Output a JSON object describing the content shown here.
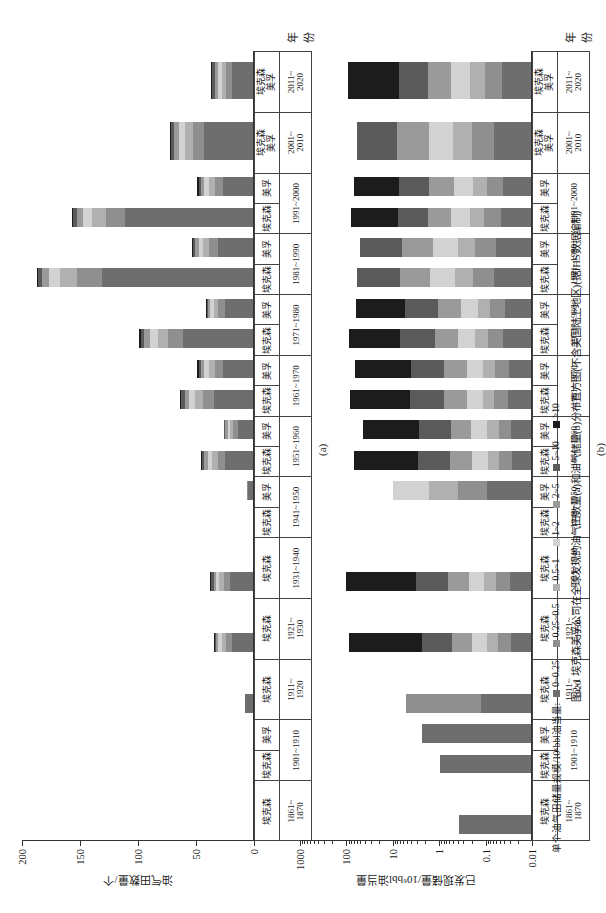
{
  "caption": "图2-1  埃克森美孚公司在全球发现的油气田数量(a)和油气储量(b)分布直方图(不含美国陆上地区)(据IHS数据编制)",
  "legend": {
    "title": "单个油气田储量规模/10⁶bbl油当量:",
    "items": [
      {
        "label": "0~0.25",
        "color": "#6e6e6e"
      },
      {
        "label": "0.25~0.5",
        "color": "#8f8f8f"
      },
      {
        "label": "0.5~1",
        "color": "#b0b0b0"
      },
      {
        "label": "1~2",
        "color": "#d2d2d2"
      },
      {
        "label": "2~5",
        "color": "#9a9a9a"
      },
      {
        "label": "5~10",
        "color": "#5a5a5a"
      },
      {
        "label": ">10",
        "color": "#1c1c1c"
      }
    ]
  },
  "panel_a": {
    "letter": "(a)",
    "ylabel": "油气田数量/个",
    "xlabel": "年份"
  },
  "panel_b": {
    "letter": "(b)",
    "ylabel": "已发现储量/10⁶bbl油当量",
    "xlabel": "年份"
  },
  "companies": {
    "exxon": "埃克森",
    "mobil": "美孚"
  },
  "decades": [
    "1861~1870",
    "1901~1910",
    "1911~1920",
    "1921~1930",
    "1931~1940",
    "1941~1950",
    "1951~1960",
    "1961~1970",
    "1971~1980",
    "1981~1990",
    "1991~2000",
    "2001~2010",
    "2011~2020"
  ],
  "chart_data": [
    {
      "type": "bar",
      "id": "a",
      "title": "油气田数量(a)",
      "xlabel": "年份",
      "ylabel": "油气田数量/个",
      "ylim": [
        0,
        200
      ],
      "yticks": [
        0,
        50,
        100,
        150,
        200
      ],
      "scale": "linear",
      "grid": false,
      "legend_position": "bottom",
      "stack_order": [
        "0~0.25",
        "0.25~0.5",
        "0.5~1",
        "1~2",
        "2~5",
        "5~10",
        ">10"
      ],
      "categories": [
        "1861~1870 埃克森",
        "1901~1910 埃克森",
        "1901~1910 美孚",
        "1911~1920 埃克森",
        "1921~1930 埃克森",
        "1931~1940 埃克森",
        "1941~1950 埃克森",
        "1941~1950 美孚",
        "1951~1960 埃克森",
        "1951~1960 美孚",
        "1961~1970 埃克森",
        "1961~1970 美孚",
        "1971~1980 埃克森",
        "1971~1980 美孚",
        "1981~1990 埃克森",
        "1981~1990 美孚",
        "1991~2000 埃克森",
        "1991~2000 美孚",
        "2001~2010 埃克森美孚",
        "2011~2020 埃克森美孚"
      ],
      "bars": [
        {
          "decade": "1861~1870",
          "company": "埃克森",
          "segments": [
            0,
            0,
            0,
            0,
            0,
            0,
            0
          ]
        },
        {
          "decade": "1901~1910",
          "company": "埃克森",
          "segments": [
            0,
            0,
            0,
            0,
            0,
            0,
            0
          ]
        },
        {
          "decade": "1901~1910",
          "company": "美孚",
          "segments": [
            0,
            0,
            0,
            0,
            0,
            0,
            0
          ]
        },
        {
          "decade": "1911~1920",
          "company": "埃克森",
          "segments": [
            7,
            0,
            0,
            0,
            0,
            0,
            0
          ]
        },
        {
          "decade": "1921~1930",
          "company": "埃克森",
          "segments": [
            18,
            5,
            4,
            3,
            2,
            1,
            1
          ]
        },
        {
          "decade": "1931~1940",
          "company": "埃克森",
          "segments": [
            20,
            5,
            4,
            3,
            2,
            2,
            1
          ]
        },
        {
          "decade": "1941~1950",
          "company": "埃克森",
          "segments": [
            0,
            0,
            0,
            0,
            0,
            0,
            0
          ]
        },
        {
          "decade": "1941~1950",
          "company": "美孚",
          "segments": [
            4,
            1,
            0,
            0,
            0,
            0,
            0
          ]
        },
        {
          "decade": "1951~1960",
          "company": "埃克森",
          "segments": [
            24,
            6,
            5,
            4,
            3,
            2,
            1
          ]
        },
        {
          "decade": "1951~1960",
          "company": "美孚",
          "segments": [
            13,
            4,
            3,
            2,
            2,
            1,
            0
          ]
        },
        {
          "decade": "1961~1970",
          "company": "埃克森",
          "segments": [
            34,
            9,
            7,
            5,
            4,
            3,
            1
          ]
        },
        {
          "decade": "1961~1970",
          "company": "美孚",
          "segments": [
            26,
            7,
            5,
            4,
            3,
            2,
            1
          ]
        },
        {
          "decade": "1971~1980",
          "company": "埃克森",
          "segments": [
            60,
            13,
            9,
            7,
            5,
            3,
            1
          ]
        },
        {
          "decade": "1971~1980",
          "company": "美孚",
          "segments": [
            24,
            6,
            4,
            3,
            2,
            1,
            1
          ]
        },
        {
          "decade": "1981~1990",
          "company": "埃克森",
          "segments": [
            130,
            22,
            14,
            10,
            6,
            3,
            1
          ]
        },
        {
          "decade": "1981~1990",
          "company": "美孚",
          "segments": [
            30,
            8,
            5,
            4,
            3,
            2,
            1
          ]
        },
        {
          "decade": "1991~2000",
          "company": "埃克森",
          "segments": [
            110,
            17,
            12,
            8,
            5,
            3,
            1
          ]
        },
        {
          "decade": "1991~2000",
          "company": "美孚",
          "segments": [
            26,
            7,
            5,
            4,
            3,
            2,
            1
          ]
        },
        {
          "decade": "2001~2010",
          "company": "埃克森美孚",
          "segments": [
            42,
            10,
            7,
            5,
            4,
            3,
            1
          ]
        },
        {
          "decade": "2011~2020",
          "company": "埃克森美孚",
          "segments": [
            18,
            5,
            4,
            3,
            3,
            2,
            1
          ]
        }
      ]
    },
    {
      "type": "bar",
      "id": "b",
      "title": "油气储量(b)",
      "xlabel": "年份",
      "ylabel": "已发现储量/10⁶bbl油当量",
      "ylim": [
        0.01,
        1000
      ],
      "yticks": [
        0.01,
        0.1,
        1,
        10,
        100,
        1000
      ],
      "scale": "log",
      "grid": false,
      "legend_position": "bottom",
      "stack_order": [
        "0~0.25",
        "0.25~0.5",
        "0.5~1",
        "1~2",
        "2~5",
        "5~10",
        ">10"
      ],
      "bars": [
        {
          "decade": "1861~1870",
          "company": "埃克森",
          "segments": [
            0.35,
            0,
            0,
            0,
            0,
            0,
            0
          ]
        },
        {
          "decade": "1901~1910",
          "company": "埃克森",
          "segments": [
            0.9,
            0,
            0,
            0,
            0,
            0,
            0
          ]
        },
        {
          "decade": "1901~1910",
          "company": "美孚",
          "segments": [
            2.2,
            0,
            0,
            0,
            0,
            0,
            0
          ]
        },
        {
          "decade": "1911~1920",
          "company": "埃克森",
          "segments": [
            2.0,
            3.0,
            0,
            0,
            0,
            0,
            0
          ]
        },
        {
          "decade": "1921~1930",
          "company": "埃克森",
          "segments": [
            9,
            6,
            5,
            7,
            9,
            14,
            33
          ]
        },
        {
          "decade": "1931~1940",
          "company": "埃克森",
          "segments": [
            11,
            7,
            6,
            8,
            11,
            16,
            36
          ]
        },
        {
          "decade": "1941~1950",
          "company": "美孚",
          "segments": [
            3.0,
            2.0,
            2.0,
            2.5,
            0,
            0,
            0
          ]
        },
        {
          "decade": "1951~1960",
          "company": "埃克森",
          "segments": [
            7,
            5,
            4,
            6,
            8,
            12,
            24
          ]
        },
        {
          "decade": "1951~1960",
          "company": "美孚",
          "segments": [
            5,
            3,
            3,
            4,
            5,
            8,
            14
          ]
        },
        {
          "decade": "1961~1970",
          "company": "埃克森",
          "segments": [
            10,
            6,
            5,
            7,
            10,
            15,
            26
          ]
        },
        {
          "decade": "1961~1970",
          "company": "美孚",
          "segments": [
            8,
            5,
            4,
            6,
            8,
            12,
            20
          ]
        },
        {
          "decade": "1971~1980",
          "company": "埃克森",
          "segments": [
            13,
            7,
            6,
            8,
            11,
            16,
            24
          ]
        },
        {
          "decade": "1971~1980",
          "company": "美孚",
          "segments": [
            9,
            5,
            4,
            6,
            8,
            11,
            17
          ]
        },
        {
          "decade": "1981~1990",
          "company": "埃克森",
          "segments": [
            12,
            7,
            6,
            8,
            10,
            14,
            0
          ]
        },
        {
          "decade": "1981~1990",
          "company": "美孚",
          "segments": [
            10,
            6,
            5,
            7,
            9,
            12,
            0
          ]
        },
        {
          "decade": "1991~2000",
          "company": "埃克森",
          "segments": [
            13,
            7,
            6,
            8,
            10,
            13,
            20
          ]
        },
        {
          "decade": "1991~2000",
          "company": "美孚",
          "segments": [
            10,
            6,
            5,
            7,
            9,
            11,
            16
          ]
        },
        {
          "decade": "2001~2010",
          "company": "埃克森美孚",
          "segments": [
            12,
            7,
            6,
            8,
            10,
            13,
            0
          ]
        },
        {
          "decade": "2011~2020",
          "company": "埃克森美孚",
          "segments": [
            14,
            8,
            7,
            9,
            11,
            14,
            24
          ]
        }
      ]
    }
  ]
}
